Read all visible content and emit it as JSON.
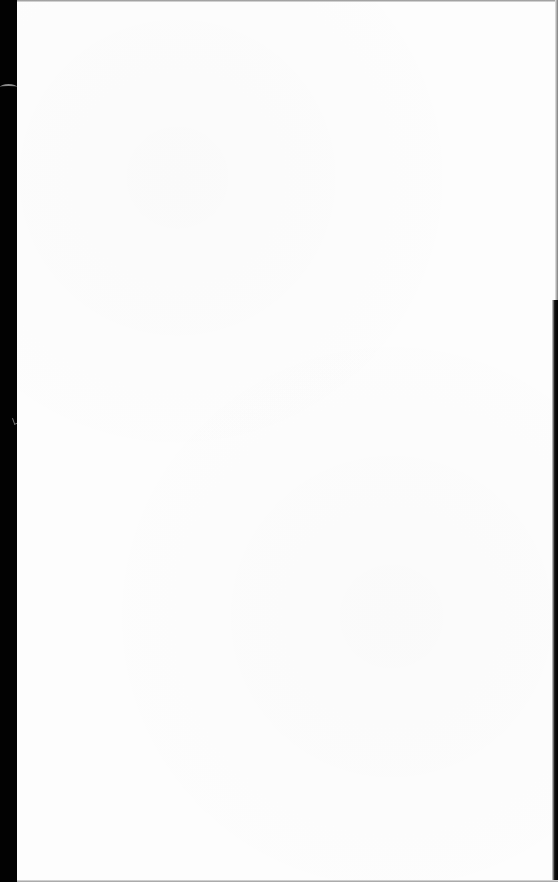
{
  "document": {
    "type": "scanned-page",
    "content": "",
    "colors": {
      "page": "#fdfdfd",
      "scan_border": "#020202"
    }
  }
}
